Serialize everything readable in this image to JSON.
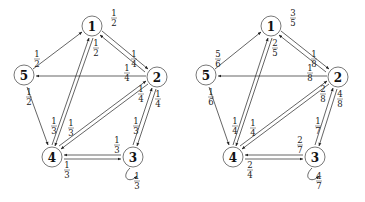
{
  "graphs": [
    {
      "id": "left",
      "nodes": [
        {
          "id": "1",
          "label": "1",
          "x": 92,
          "y": 26
        },
        {
          "id": "2",
          "label": "2",
          "x": 157,
          "y": 77
        },
        {
          "id": "3",
          "label": "3",
          "x": 133,
          "y": 157
        },
        {
          "id": "4",
          "label": "4",
          "x": 52,
          "y": 157
        },
        {
          "id": "5",
          "label": "5",
          "x": 24,
          "y": 75
        }
      ],
      "weights": {
        "w1_2_top": {
          "num": "1",
          "den": "2"
        },
        "w1_4": {
          "num": "1",
          "den": "2"
        },
        "w2_1": {
          "num": "1",
          "den": "4"
        },
        "w2_5": {
          "num": "1",
          "den": "4"
        },
        "w2_4": {
          "num": "1",
          "den": "4"
        },
        "w2_3": {
          "num": "1",
          "den": "4"
        },
        "w5_1": {
          "num": "1",
          "den": "2"
        },
        "w5_4": {
          "num": "1",
          "den": "2"
        },
        "w4_1": {
          "num": "1",
          "den": "3"
        },
        "w4_2": {
          "num": "1",
          "den": "3"
        },
        "w4_3": {
          "num": "1",
          "den": "3"
        },
        "w3_2": {
          "num": "1",
          "den": "3"
        },
        "w3_4": {
          "num": "1",
          "den": "3"
        },
        "w3_3": {
          "num": "1",
          "den": "3"
        }
      }
    },
    {
      "id": "right",
      "nodes": [
        {
          "id": "1",
          "label": "1",
          "x": 271,
          "y": 26
        },
        {
          "id": "2",
          "label": "2",
          "x": 338,
          "y": 77
        },
        {
          "id": "3",
          "label": "3",
          "x": 315,
          "y": 157
        },
        {
          "id": "4",
          "label": "4",
          "x": 233,
          "y": 157
        },
        {
          "id": "5",
          "label": "5",
          "x": 206,
          "y": 75
        }
      ],
      "weights": {
        "w1_2_top": {
          "num": "3",
          "den": "5"
        },
        "w1_4": {
          "num": "2",
          "den": "5"
        },
        "w2_1": {
          "num": "1",
          "den": "8"
        },
        "w2_5": {
          "num": "1",
          "den": "8"
        },
        "w2_4": {
          "num": "2",
          "den": "8"
        },
        "w2_3": {
          "num": "4",
          "den": "8"
        },
        "w5_1": {
          "num": "5",
          "den": "6"
        },
        "w5_4": {
          "num": "1",
          "den": "6"
        },
        "w4_1": {
          "num": "1",
          "den": "4"
        },
        "w4_2": {
          "num": "1",
          "den": "4"
        },
        "w4_3": {
          "num": "2",
          "den": "4"
        },
        "w3_2": {
          "num": "1",
          "den": "7"
        },
        "w3_4": {
          "num": "2",
          "den": "7"
        },
        "w3_3": {
          "num": "4",
          "den": "7"
        }
      }
    }
  ]
}
